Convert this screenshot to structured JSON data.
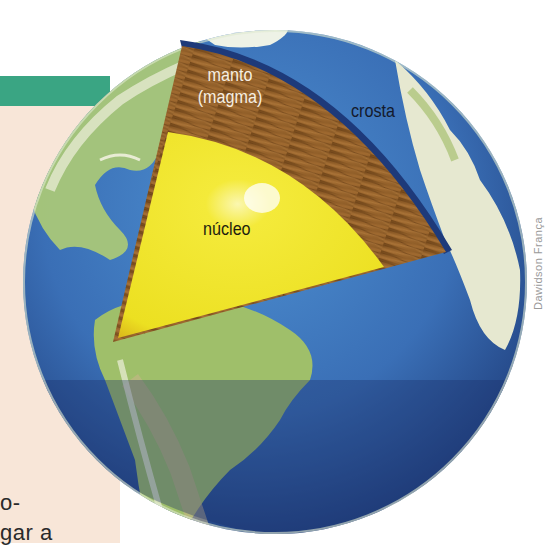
{
  "figure": {
    "type": "earth-layers-cutaway",
    "labels": {
      "mantle": [
        "manto",
        "(magma)"
      ],
      "crust": "crosta",
      "core": "núcleo"
    },
    "credit": "Dawidson França"
  },
  "page_fragment": {
    "text_lines": [
      "o-",
      "gar a"
    ]
  },
  "colors": {
    "ocean": "#3d78bd",
    "ocean_dark": "#1c3a78",
    "land_green": "#9fbf6a",
    "land_light": "#e8ecd4",
    "mantle": "#8a5a26",
    "mantle_light": "#b07a3a",
    "core": "#f2e52a",
    "core_edge": "#e2c51c",
    "teal_bar": "#3aa583",
    "page_bg": "#f8e6d8"
  }
}
